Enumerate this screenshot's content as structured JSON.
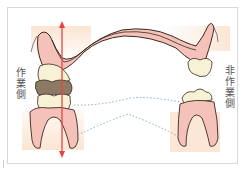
{
  "diagram": {
    "type": "dental-occlusion-cross-section",
    "labels": {
      "working_side": "作業側",
      "non_working_side": "非作業側"
    },
    "elements": {
      "upper_arch": "maxillary arch with palate (pink gingiva, dark outline)",
      "working_side_teeth": "upper and lower teeth in contact on left side",
      "non_working_side_teeth": "separated upper and lower teeth on right side",
      "lower_arch": "mandible outline drawn as dotted blue lines",
      "force_arrow": "red double-ended vertical arrow on working side"
    },
    "colors": {
      "gingiva": "#f4c2b8",
      "gingiva_outline": "#3a2a22",
      "tooth_enamel": "#f7f2d6",
      "tooth_contact_brown": "#8c7a64",
      "bone_background": "#fbe3d0",
      "arrow": "#e8433f",
      "dotted_line": "#8ea6cc",
      "label_text": "#555555",
      "frame_border": "#d8d8d8"
    }
  }
}
